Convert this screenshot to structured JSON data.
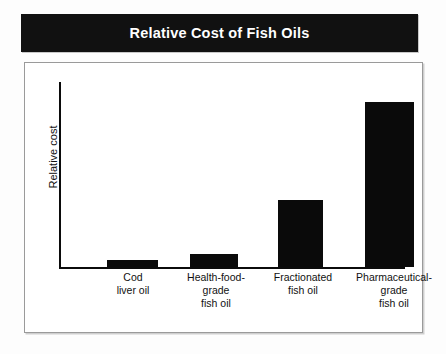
{
  "title": "Relative Cost of Fish Oils",
  "colors": {
    "title_bar_background": "#111111",
    "title_text": "#ffffff",
    "bar_fill": "#0a0a0a",
    "axis_line": "#0b0b0b",
    "frame_border": "#9a9a9a",
    "page_background": "#fdfdfd"
  },
  "axes": {
    "y_label": "Relative cost",
    "x_label": ""
  },
  "chart_data": {
    "type": "bar",
    "title": "Relative Cost of Fish Oils",
    "xlabel": "",
    "ylabel": "Relative cost",
    "ylim": [
      0,
      100
    ],
    "grid": false,
    "legend": "none",
    "tick_labels_y": [],
    "categories": [
      "Cod liver oil",
      "Health-food-grade fish oil",
      "Fractionated fish oil",
      "Pharmaceutical-grade fish oil"
    ],
    "category_lines": [
      [
        "Cod",
        "liver oil"
      ],
      [
        "Health-food-",
        "grade",
        "fish oil"
      ],
      [
        "Fractionated",
        "fish oil"
      ],
      [
        "Pharmaceutical-",
        "grade",
        "fish oil"
      ]
    ],
    "values": [
      4,
      7,
      36,
      89
    ]
  }
}
